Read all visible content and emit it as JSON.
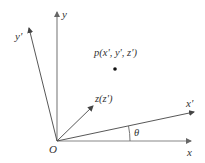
{
  "diagram": {
    "origin_label": "O",
    "axes": {
      "x": "x",
      "y": "y",
      "x_prime": "x'",
      "y_prime": "y'",
      "z": "z(z')"
    },
    "point_label": "p(x', y', z')",
    "angle_label": "θ",
    "colors": {
      "axis": "#777777",
      "rotated_axis": "#444444",
      "text": "#333333",
      "point": "#111111"
    }
  }
}
